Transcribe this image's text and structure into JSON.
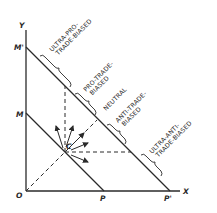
{
  "axes": {
    "y_label": "Y",
    "x_label": "X",
    "origin_label": "O"
  },
  "points": {
    "m_prime": "M'",
    "m": "M",
    "p": "P",
    "p_prime": "P'",
    "c": "C"
  },
  "regions": [
    {
      "id": "ultra-pro",
      "line1": "ULTRA-PRO-",
      "line2": "TRADE-BIASED"
    },
    {
      "id": "pro",
      "line1": "PRO-TRADE-",
      "line2": "BIASED"
    },
    {
      "id": "neutral",
      "line1": "NEUTRAL",
      "line2": ""
    },
    {
      "id": "anti",
      "line1": "ANTI-TRADE-",
      "line2": "BIASED"
    },
    {
      "id": "ultra-anti",
      "line1": "ULTRA-ANTI-",
      "line2": "TRADE-BIASED"
    }
  ],
  "colors": {
    "ink": "#2a2a2a",
    "background": "#ffffff"
  }
}
